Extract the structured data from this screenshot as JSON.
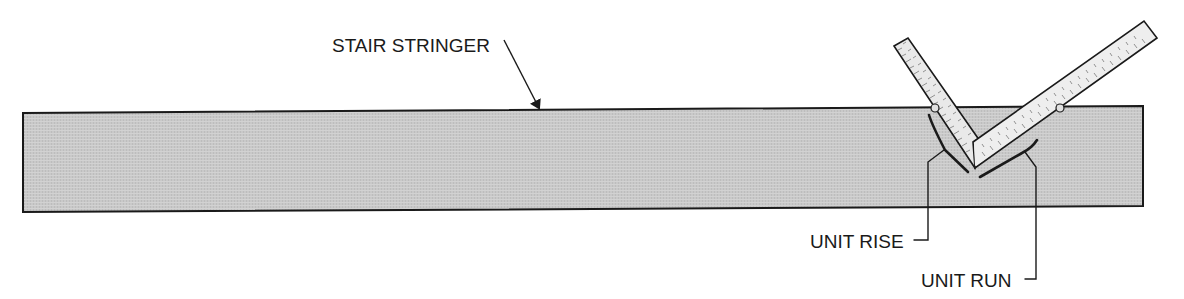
{
  "diagram": {
    "labels": {
      "stringer": "STAIR STRINGER",
      "unit_rise": "UNIT RISE",
      "unit_run": "UNIT RUN"
    },
    "colors": {
      "stringer_fill": "#c8c8c8",
      "outline": "#1a1a1a",
      "square_fill": "#eeeeee",
      "tick_marks": "#777777",
      "background": "#ffffff"
    },
    "components": [
      {
        "name": "stair-stringer",
        "description": "long gray board"
      },
      {
        "name": "framing-square",
        "description": "L-shaped steel square with graduated scales placed on stringer"
      },
      {
        "name": "pin-gauge-rise",
        "description": "stair gauge on rise tongue"
      },
      {
        "name": "pin-gauge-run",
        "description": "stair gauge on run blade"
      }
    ]
  }
}
